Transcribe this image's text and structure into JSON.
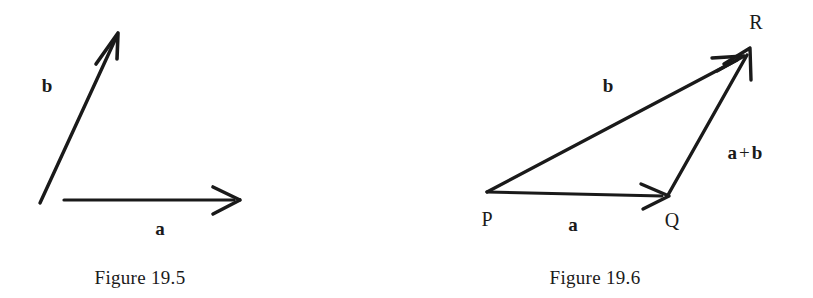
{
  "page": {
    "background_color": "#ffffff",
    "ink_color": "#1a1a1a",
    "width": 813,
    "height": 298
  },
  "figures": [
    {
      "id": "figure-19-5",
      "caption": "Figure 19.5",
      "caption_position": {
        "x": 140,
        "y": 277
      },
      "description": "Two vectors a and b drawn from a common origin point",
      "vectors": [
        {
          "name": "b",
          "label": "b",
          "label_position": {
            "x": 47,
            "y": 85
          },
          "start": {
            "x": 40,
            "y": 203
          },
          "end": {
            "x": 118,
            "y": 33
          },
          "arrowhead": "barbed-open"
        },
        {
          "name": "a",
          "label": "a",
          "label_position": {
            "x": 160,
            "y": 228
          },
          "start": {
            "x": 64,
            "y": 200
          },
          "end": {
            "x": 240,
            "y": 200
          },
          "arrowhead": "barbed-open"
        }
      ],
      "points": []
    },
    {
      "id": "figure-19-6",
      "caption": "Figure 19.6",
      "caption_position": {
        "x": 595,
        "y": 277
      },
      "description": "Triangle law of vector addition: a from P to Q, a plus b from Q to R, b from P to R",
      "vectors": [
        {
          "name": "a",
          "label": "a",
          "label_position": {
            "x": 573,
            "y": 224
          },
          "start": {
            "x": 487,
            "y": 192
          },
          "end": {
            "x": 668,
            "y": 196
          },
          "arrowhead": "barbed-open"
        },
        {
          "name": "b",
          "label": "b",
          "label_position": {
            "x": 608,
            "y": 85
          },
          "start": {
            "x": 487,
            "y": 192
          },
          "end": {
            "x": 742,
            "y": 57
          },
          "arrowhead": "barbed-open"
        },
        {
          "name": "a+b",
          "label_parts": {
            "first": "a",
            "operator": "+",
            "second": "b"
          },
          "label_position": {
            "x": 745,
            "y": 152
          },
          "start": {
            "x": 668,
            "y": 195
          },
          "end": {
            "x": 750,
            "y": 48
          },
          "arrowhead": "barbed-open"
        }
      ],
      "points": [
        {
          "name": "P",
          "label": "P",
          "label_position": {
            "x": 487,
            "y": 219
          },
          "vertex": {
            "x": 487,
            "y": 192
          }
        },
        {
          "name": "Q",
          "label": "Q",
          "label_position": {
            "x": 672,
            "y": 220
          },
          "vertex": {
            "x": 668,
            "y": 195
          }
        },
        {
          "name": "R",
          "label": "R",
          "label_position": {
            "x": 756,
            "y": 22
          },
          "vertex": {
            "x": 748,
            "y": 50
          }
        }
      ]
    }
  ]
}
